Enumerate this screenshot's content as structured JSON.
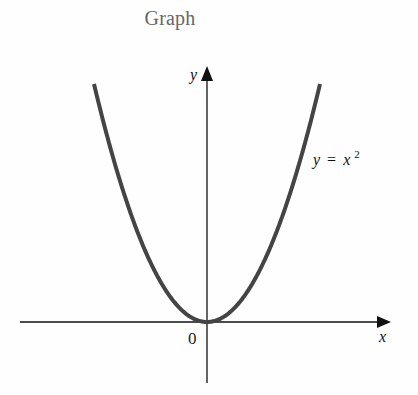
{
  "title": "Graph",
  "colors": {
    "background": "#ffffff",
    "title": "#666666",
    "axes": "#111111",
    "curve": "#444444"
  },
  "labels": {
    "x_axis": "x",
    "y_axis": "y",
    "origin": "0",
    "curve_lhs": "y",
    "curve_eq": "=",
    "curve_rhs_base": "x",
    "curve_rhs_exp": "2"
  },
  "chart_data": {
    "type": "line",
    "title": "Graph",
    "xlabel": "x",
    "ylabel": "y",
    "function": "y = x^2",
    "series": [
      {
        "name": "y = x^2",
        "x": [
          -2.0,
          -1.5,
          -1.0,
          -0.5,
          0.0,
          0.5,
          1.0,
          1.5,
          2.0
        ],
        "values": [
          4.0,
          2.25,
          1.0,
          0.25,
          0.0,
          0.25,
          1.0,
          2.25,
          4.0
        ]
      }
    ],
    "annotations": [
      {
        "text": "y = x²",
        "position": "right of curve, upper right"
      },
      {
        "text": "0",
        "position": "origin, below-left"
      }
    ],
    "tick_labels": {
      "x": [
        "0"
      ],
      "y": []
    },
    "xlim": [
      -3.4,
      3.2
    ],
    "ylim": [
      -1.1,
      4.5
    ],
    "grid": false,
    "legend": null
  }
}
